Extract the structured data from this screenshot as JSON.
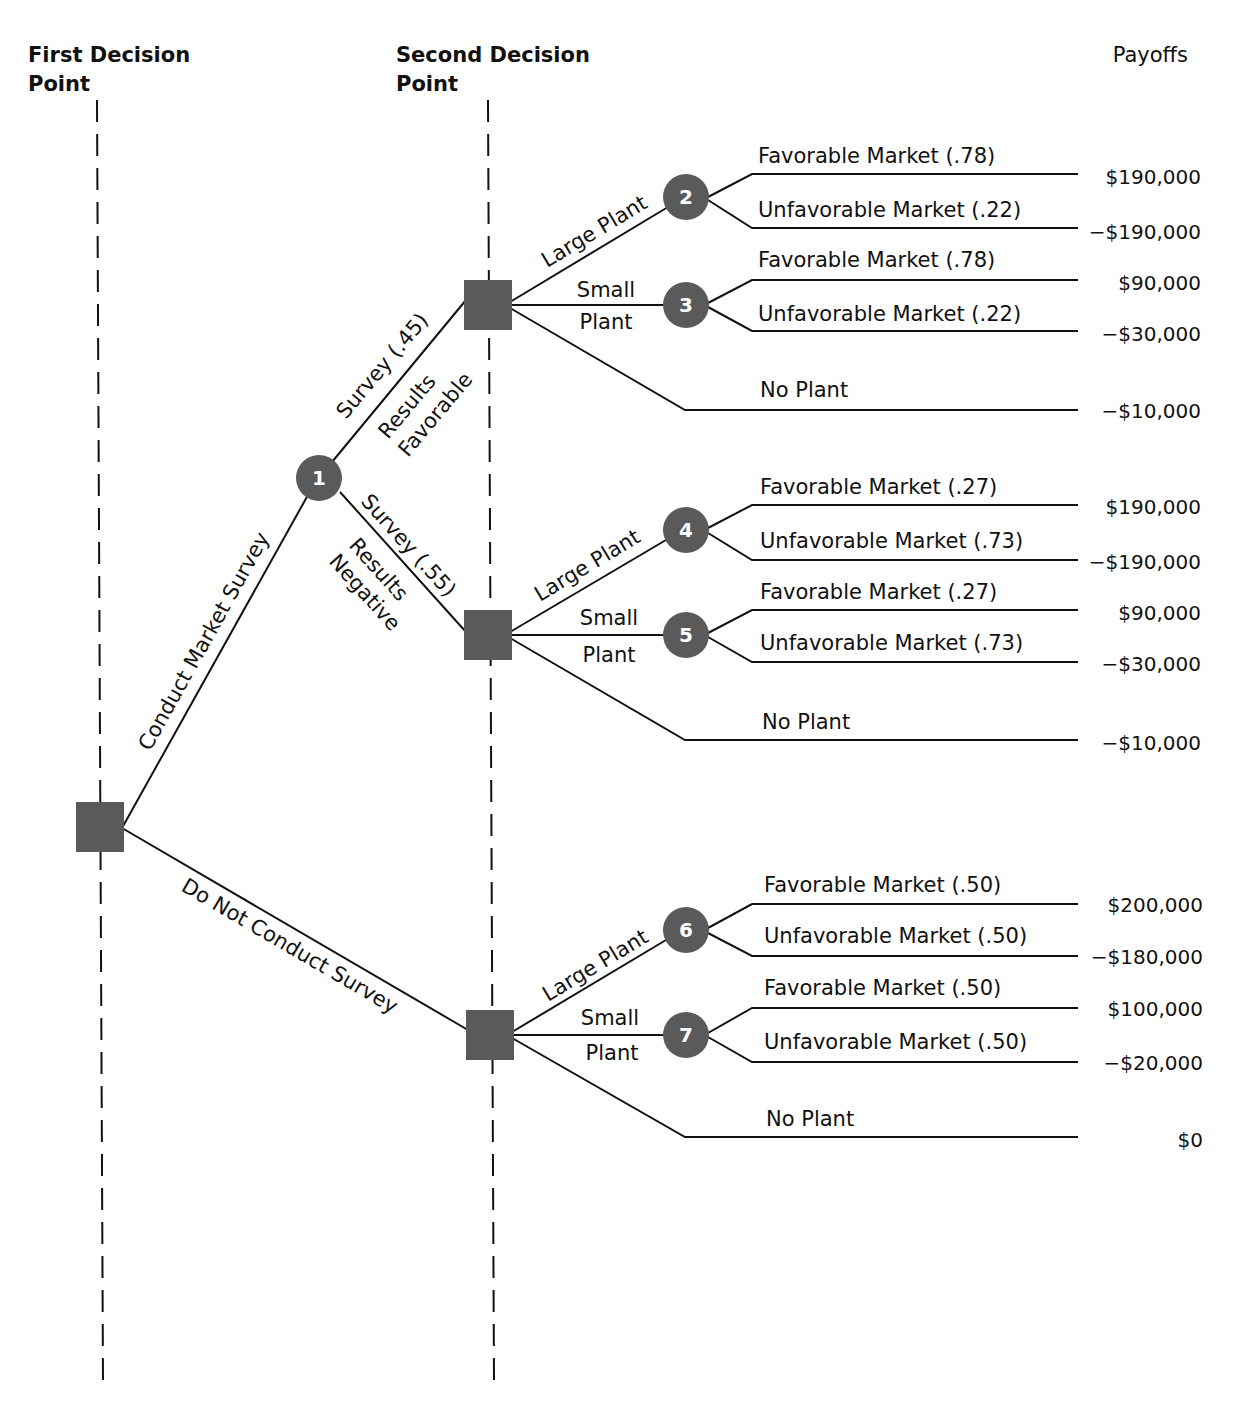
{
  "headers": {
    "first_line1": "First Decision",
    "first_line2": "Point",
    "second_line1": "Second Decision",
    "second_line2": "Point",
    "payoffs": "Payoffs"
  },
  "colors": {
    "node": "#5a5a5a",
    "line": "#111111"
  },
  "branches": {
    "conduct": "Conduct Market Survey",
    "no_conduct": "Do Not Conduct Survey",
    "fav_a": "Survey (.45)",
    "fav_b": "Results",
    "fav_c": "Favorable",
    "neg_a": "Survey (.55)",
    "neg_b": "Results",
    "neg_c": "Negative"
  },
  "groups": [
    {
      "large": "Large Plant",
      "small1": "Small",
      "small2": "Plant",
      "none": "No Plant",
      "large_node": "2",
      "small_node": "3",
      "l_fav": "Favorable Market (.78)",
      "l_unf": "Unfavorable Market (.22)",
      "s_fav": "Favorable Market (.78)",
      "s_unf": "Unfavorable Market (.22)",
      "payoffs": [
        "$190,000",
        "−$190,000",
        "$90,000",
        "−$30,000",
        "−$10,000"
      ]
    },
    {
      "large": "Large Plant",
      "small1": "Small",
      "small2": "Plant",
      "none": "No Plant",
      "large_node": "4",
      "small_node": "5",
      "l_fav": "Favorable Market (.27)",
      "l_unf": "Unfavorable Market (.73)",
      "s_fav": "Favorable Market (.27)",
      "s_unf": "Unfavorable Market (.73)",
      "payoffs": [
        "$190,000",
        "−$190,000",
        "$90,000",
        "−$30,000",
        "−$10,000"
      ]
    },
    {
      "large": "Large Plant",
      "small1": "Small",
      "small2": "Plant",
      "none": "No Plant",
      "large_node": "6",
      "small_node": "7",
      "l_fav": "Favorable Market (.50)",
      "l_unf": "Unfavorable Market (.50)",
      "s_fav": "Favorable Market (.50)",
      "s_unf": "Unfavorable Market (.50)",
      "payoffs": [
        "$200,000",
        "−$180,000",
        "$100,000",
        "−$20,000",
        "$0"
      ]
    }
  ],
  "root_node": "1"
}
